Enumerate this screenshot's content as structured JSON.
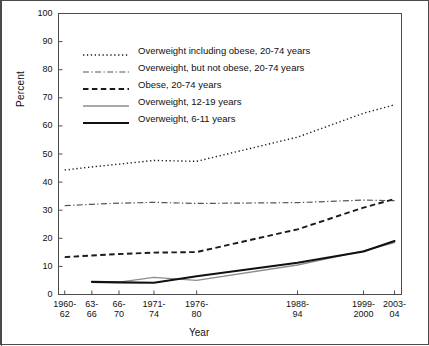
{
  "figure": {
    "axis_x_title": "Year",
    "axis_y_title": "Percent",
    "border_color": "#4a4a4a"
  },
  "legend": {
    "position": "inside-top-left",
    "items": [
      {
        "label": "Overweight including obese, 20-74 years",
        "style": "dotted",
        "color": "#1a1a1a",
        "width": 1.4,
        "key": "legend-key-overweight-including-obese"
      },
      {
        "label": "Overweight, but not obese, 20-74 years",
        "style": "dashdot",
        "color": "#555555",
        "width": 1.2,
        "key": "legend-key-overweight-not-obese"
      },
      {
        "label": "Obese, 20-74 years",
        "style": "dashed",
        "color": "#1a1a1a",
        "width": 1.9,
        "key": "legend-key-obese"
      },
      {
        "label": "Overweight, 12-19 years",
        "style": "solid",
        "color": "#8c8c8c",
        "width": 1.3,
        "key": "legend-key-overweight-12-19"
      },
      {
        "label": "Overweight, 6-11 years",
        "style": "solid",
        "color": "#111111",
        "width": 2.1,
        "key": "legend-key-overweight-6-11"
      }
    ]
  },
  "chart_data": {
    "type": "line",
    "title": "",
    "xlabel": "Year",
    "ylabel": "Percent",
    "ylim": [
      0,
      100
    ],
    "yticks": [
      0,
      10,
      20,
      30,
      40,
      50,
      60,
      70,
      80,
      90,
      100
    ],
    "grid": false,
    "legend_position": "inside-top-left",
    "categories": [
      "1960-62",
      "63-66",
      "66-70",
      "1971-74",
      "1976-80",
      "1988-94",
      "1999-2000",
      "2003-04"
    ],
    "tick_labels_line1": [
      "1960-",
      "63-",
      "66-",
      "1971-",
      "1976-",
      "1988-",
      "1999-",
      "2003-"
    ],
    "tick_labels_line2": [
      "62",
      "66",
      "70",
      "74",
      "80",
      "94",
      "2000",
      "04"
    ],
    "x_positions": [
      1961,
      1964.5,
      1968,
      1972.5,
      1978,
      1991,
      1999.5,
      2003.5
    ],
    "xlim": [
      1960.2,
      2004.4
    ],
    "series": [
      {
        "name": "Overweight including obese, 20-74 years",
        "style": "dotted",
        "color": "#1a1a1a",
        "values": [
          44.3,
          45.4,
          46.4,
          47.7,
          47.4,
          56.0,
          64.5,
          67.5
        ]
      },
      {
        "name": "Overweight, but not obese, 20-74 years",
        "style": "dashdot",
        "color": "#555555",
        "values": [
          31.6,
          32.1,
          32.5,
          32.8,
          32.4,
          32.7,
          33.6,
          33.4
        ]
      },
      {
        "name": "Obese, 20-74 years",
        "style": "dashed",
        "color": "#1a1a1a",
        "values": [
          13.3,
          13.9,
          14.4,
          14.9,
          15.1,
          23.2,
          30.9,
          34.0
        ]
      },
      {
        "name": "Overweight, 12-19 years",
        "style": "solid",
        "color": "#8c8c8c",
        "values": [
          null,
          4.6,
          4.4,
          6.1,
          5.0,
          10.5,
          15.5,
          18.5
        ]
      },
      {
        "name": "Overweight, 6-11 years",
        "style": "solid",
        "color": "#111111",
        "values": [
          null,
          4.5,
          4.3,
          4.2,
          6.5,
          11.3,
          15.3,
          19.0
        ]
      }
    ]
  }
}
